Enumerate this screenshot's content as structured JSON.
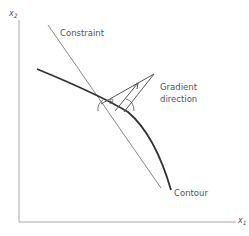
{
  "diagram": {
    "axes": {
      "y_label_base": "x",
      "y_label_sub": "2",
      "x_label_base": "x",
      "x_label_sub": "1"
    },
    "labels": {
      "constraint": "Constraint",
      "gradient_line1": "Gradient",
      "gradient_line2": "direction",
      "contour": "Contour",
      "angle": "θ"
    },
    "colors": {
      "axis": "#999999",
      "constraint": "#888888",
      "contour": "#333333",
      "gradient": "#555555",
      "text": "#555555"
    }
  }
}
